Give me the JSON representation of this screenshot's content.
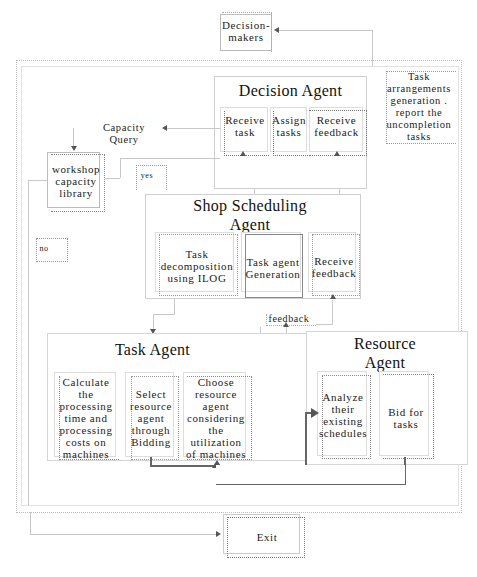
{
  "diagram": {
    "decision_makers": "Decision-\nmakers",
    "decision_agent": {
      "title": "Decision Agent",
      "steps": [
        "Receive\ntask",
        "Assign\ntasks",
        "Receive\nfeedback"
      ]
    },
    "task_arrangements": "Task\narrangements\ngeneration .\nreport the\nuncompletion\ntasks",
    "capacity_query": "Capacity Query",
    "workshop_library": "workshop\ncapacity\nlibrary",
    "yes_label": "yes",
    "no_label": "no",
    "shop_scheduling_agent": {
      "title": "Shop Scheduling\nAgent",
      "steps": [
        "Task\ndecomposition\nusing ILOG",
        "Task agent\nGeneration",
        "Receive\nfeedback"
      ]
    },
    "feedback_label": "feedback",
    "task_agent": {
      "title": "Task Agent",
      "steps": [
        "Calculate\nthe\nprocessing\ntime and\nprocessing\ncosts on\nmachines",
        "Select\nresource\nagent\nthrough\nBidding",
        "Choose\nresource\nagent\nconsidering\nthe\nutilization\nof machines"
      ]
    },
    "resource_agent": {
      "title": "Resource\nAgent",
      "steps": [
        "Analyze\ntheir\nexisting\nschedules",
        "Bid for\ntasks"
      ]
    },
    "exit": "Exit"
  }
}
